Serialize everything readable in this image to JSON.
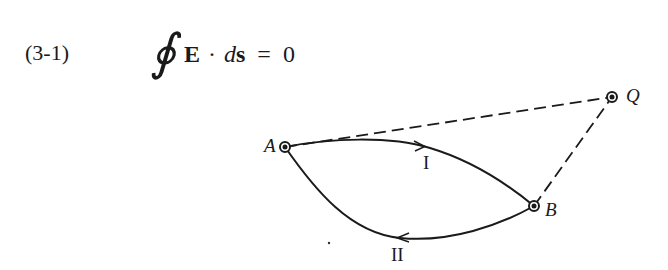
{
  "equation": {
    "number": "(3-1)",
    "integral_symbol": "∮",
    "vector_field": "E",
    "dot_operator": "·",
    "differential_d": "d",
    "differential_s": "s",
    "equals": "=",
    "rhs": "0"
  },
  "diagram": {
    "points": [
      {
        "id": "A",
        "label": "A",
        "x": 285,
        "y": 147
      },
      {
        "id": "B",
        "label": "B",
        "x": 534,
        "y": 206
      },
      {
        "id": "Q",
        "label": "Q",
        "x": 612,
        "y": 97
      }
    ],
    "paths": [
      {
        "id": "path-I",
        "label": "I",
        "from": "A",
        "to": "B",
        "direction": "A to B",
        "style": "solid"
      },
      {
        "id": "path-II",
        "label": "II",
        "from": "B",
        "to": "A",
        "direction": "B to A",
        "style": "solid"
      }
    ],
    "dashed_lines": [
      {
        "from": "A",
        "to": "Q"
      },
      {
        "from": "B",
        "to": "Q"
      }
    ],
    "colors": {
      "ink": "#1a1a1a",
      "background": "#ffffff"
    }
  }
}
